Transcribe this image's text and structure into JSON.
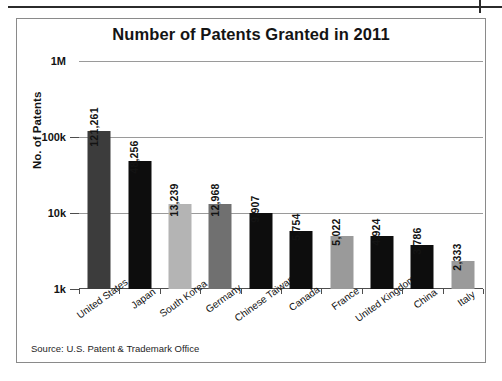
{
  "figure": {
    "title": "Number of Patents Granted in 2011",
    "source_note": "Source: U.S. Patent & Trademark Office"
  },
  "chart_data": {
    "type": "bar",
    "title": "Number of Patents Granted in 2011",
    "xlabel": "",
    "ylabel": "No. of Patents",
    "yscale": "log",
    "ylim": [
      1000,
      1000000
    ],
    "ytick_labels": [
      "1M",
      "100k",
      "10k",
      "1k"
    ],
    "ytick_values": [
      1000000,
      100000,
      10000,
      1000
    ],
    "grid": true,
    "legend": false,
    "categories": [
      "United States",
      "Japan",
      "South Korea",
      "Germany",
      "Chinese Taiwan",
      "Canada",
      "France",
      "United Kingdom",
      "China",
      "Italy"
    ],
    "values": [
      121261,
      48256,
      13239,
      12968,
      9907,
      5754,
      5022,
      4924,
      3786,
      2333
    ],
    "value_labels": [
      "121,261",
      "48,256",
      "13,239",
      "12,968",
      "9,907",
      "5,754",
      "5,022",
      "4,924",
      "3,786",
      "2,333"
    ],
    "bar_colors": [
      "#3c3c3c",
      "#0d0d0d",
      "#b4b4b4",
      "#707070",
      "#0d0d0d",
      "#0d0d0d",
      "#9a9a9a",
      "#0d0d0d",
      "#0d0d0d",
      "#9a9a9a"
    ],
    "source": "Source: U.S. Patent & Trademark Office"
  },
  "colors": {
    "frame": "#8a8a8a",
    "gridline": "#9a9a9a",
    "axis": "#4d4d4d",
    "text": "#131313"
  }
}
